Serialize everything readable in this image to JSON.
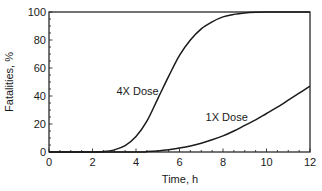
{
  "chart_data": {
    "type": "line",
    "title": "",
    "xlabel": "Time, h",
    "ylabel": "Fatalities, %",
    "xlim": [
      0,
      12
    ],
    "ylim": [
      0,
      100
    ],
    "x_ticks": [
      0,
      2,
      4,
      6,
      8,
      10,
      12
    ],
    "y_ticks": [
      0,
      20,
      40,
      60,
      80,
      100
    ],
    "x_minor_step": 0.5,
    "y_minor_step": 5,
    "grid": false,
    "legend": "none (inline curve labels)",
    "series": [
      {
        "name": "4X Dose",
        "label_pos": {
          "x": 3.1,
          "y": 41
        },
        "points": [
          [
            0,
            0
          ],
          [
            2,
            0
          ],
          [
            2.5,
            0.3
          ],
          [
            3,
            1.5
          ],
          [
            3.5,
            4.5
          ],
          [
            4,
            11
          ],
          [
            4.5,
            22
          ],
          [
            5,
            38
          ],
          [
            5.5,
            54
          ],
          [
            6,
            69
          ],
          [
            6.5,
            80
          ],
          [
            7,
            88
          ],
          [
            7.5,
            93
          ],
          [
            8,
            96.5
          ],
          [
            8.5,
            98.3
          ],
          [
            9,
            99.3
          ],
          [
            9.5,
            99.8
          ],
          [
            10,
            100
          ],
          [
            12,
            100
          ]
        ]
      },
      {
        "name": "1X Dose",
        "label_pos": {
          "x": 7.2,
          "y": 22
        },
        "points": [
          [
            0,
            0
          ],
          [
            4,
            0
          ],
          [
            4.5,
            0.3
          ],
          [
            5,
            0.8
          ],
          [
            5.5,
            1.6
          ],
          [
            6,
            2.8
          ],
          [
            6.5,
            4.3
          ],
          [
            7,
            6.3
          ],
          [
            7.5,
            8.7
          ],
          [
            8,
            11.5
          ],
          [
            8.5,
            15
          ],
          [
            9,
            19
          ],
          [
            9.5,
            23
          ],
          [
            10,
            27.5
          ],
          [
            10.5,
            32
          ],
          [
            11,
            37
          ],
          [
            11.5,
            42
          ],
          [
            12,
            47
          ]
        ]
      }
    ]
  }
}
